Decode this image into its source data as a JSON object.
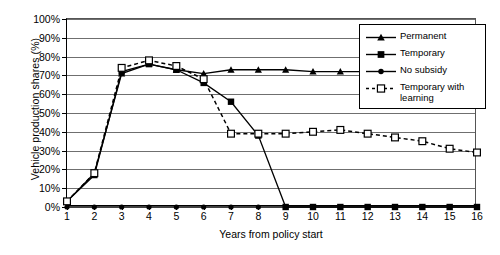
{
  "chart_data": {
    "type": "line",
    "title": "",
    "xlabel": "Years from policy start",
    "ylabel": "Vehicle production shares (%)",
    "x": [
      1,
      2,
      3,
      4,
      5,
      6,
      7,
      8,
      9,
      10,
      11,
      12,
      13,
      14,
      15,
      16
    ],
    "xlim": [
      1,
      16
    ],
    "ylim": [
      0,
      100
    ],
    "ytick_labels": [
      "0%",
      "10%",
      "20%",
      "30%",
      "40%",
      "50%",
      "60%",
      "70%",
      "80%",
      "90%",
      "100%"
    ],
    "ytick_values": [
      0,
      10,
      20,
      30,
      40,
      50,
      60,
      70,
      80,
      90,
      100
    ],
    "xtick_labels": [
      "1",
      "2",
      "3",
      "4",
      "5",
      "6",
      "7",
      "8",
      "9",
      "10",
      "11",
      "12",
      "13",
      "14",
      "15",
      "16"
    ],
    "grid": "horizontal",
    "legend_position": "top-right",
    "series": [
      {
        "name": "Permanent",
        "marker": "triangle",
        "line": "solid",
        "color": "#000000",
        "values": [
          3,
          18,
          71,
          76,
          73,
          71,
          73,
          73,
          73,
          72,
          72,
          72,
          72,
          72,
          72,
          71
        ]
      },
      {
        "name": "Temporary",
        "marker": "square-filled",
        "line": "solid",
        "color": "#000000",
        "values": [
          3,
          17,
          72,
          76,
          73,
          66,
          56,
          38,
          0,
          0,
          0,
          0,
          0,
          0,
          0,
          0
        ]
      },
      {
        "name": "No subsidy",
        "marker": "circle-filled",
        "line": "solid",
        "color": "#000000",
        "values": [
          0,
          0,
          0,
          0,
          0,
          0,
          0,
          0,
          0,
          0,
          0,
          0,
          0,
          0,
          0,
          0
        ]
      },
      {
        "name": "Temporary with learning",
        "marker": "square-open",
        "line": "dashed",
        "color": "#000000",
        "values": [
          3,
          18,
          74,
          78,
          75,
          68,
          39,
          39,
          39,
          40,
          41,
          39,
          37,
          35,
          31,
          29
        ]
      }
    ]
  },
  "legend": {
    "items": [
      {
        "label": "Permanent"
      },
      {
        "label": "Temporary"
      },
      {
        "label": "No subsidy"
      },
      {
        "label": "Temporary with\nlearning"
      }
    ]
  }
}
